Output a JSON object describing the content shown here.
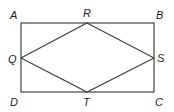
{
  "diagram": {
    "stroke_color": "#444444",
    "rectangle": {
      "name": "ABCD",
      "x1": 21,
      "y1": 23,
      "x2": 154,
      "y2": 92
    },
    "rhombus": {
      "name": "QRST",
      "points": "87,23 154,58 87,92 21,58"
    },
    "labels": [
      {
        "id": "A",
        "text": "A",
        "x": 10,
        "y": 19
      },
      {
        "id": "B",
        "text": "B",
        "x": 156,
        "y": 19
      },
      {
        "id": "C",
        "text": "C",
        "x": 155,
        "y": 106
      },
      {
        "id": "D",
        "text": "D",
        "x": 10,
        "y": 106
      },
      {
        "id": "R",
        "text": "R",
        "x": 83,
        "y": 17
      },
      {
        "id": "S",
        "text": "S",
        "x": 157,
        "y": 62
      },
      {
        "id": "T",
        "text": "T",
        "x": 83,
        "y": 106
      },
      {
        "id": "Q",
        "text": "Q",
        "x": 8,
        "y": 63
      }
    ]
  }
}
